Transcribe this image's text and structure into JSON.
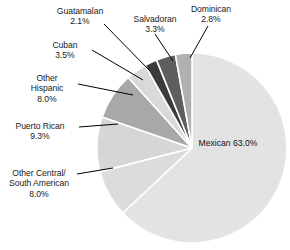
{
  "chart_data": {
    "type": "pie",
    "title": "",
    "subtitle": "",
    "xlabel": "",
    "ylabel": "",
    "legend_position": "none",
    "grid": false,
    "units": "percent",
    "total": 100.0,
    "start_angle_deg": 0,
    "direction": "clockwise",
    "categories": [
      "Mexican",
      "Other Central/ South American",
      "Puerto Rican",
      "Other Hispanic",
      "Cuban",
      "Guatamalan",
      "Salvadoran",
      "Dominican"
    ],
    "values": [
      63.0,
      8.0,
      9.3,
      8.0,
      3.5,
      2.1,
      3.3,
      2.8
    ],
    "slices": [
      {
        "name": "Mexican",
        "value": 63.0,
        "value_label": "63.0%",
        "color": "#e3e3e3",
        "label_placement": "inside"
      },
      {
        "name": "Other Central/ South American",
        "value": 8.0,
        "value_label": "8.0%",
        "color": "#dcdcdc",
        "label_placement": "outside"
      },
      {
        "name": "Puerto Rican",
        "value": 9.3,
        "value_label": "9.3%",
        "color": "#d6d6d6",
        "label_placement": "outside"
      },
      {
        "name": "Other Hispanic",
        "value": 8.0,
        "value_label": "8.0%",
        "color": "#a8a8a8",
        "label_placement": "outside"
      },
      {
        "name": "Cuban",
        "value": 3.5,
        "value_label": "3.5%",
        "color": "#d9d9d9",
        "label_placement": "outside"
      },
      {
        "name": "Guatamalan",
        "value": 2.1,
        "value_label": "2.1%",
        "color": "#3b3b3b",
        "label_placement": "outside"
      },
      {
        "name": "Salvadoran",
        "value": 3.3,
        "value_label": "3.3%",
        "color": "#5e5e5e",
        "label_placement": "outside"
      },
      {
        "name": "Dominican",
        "value": 2.8,
        "value_label": "2.8%",
        "color": "#b0b0b0",
        "label_placement": "outside"
      }
    ]
  },
  "labels": {
    "guatamalan": {
      "name": "Guatamalan",
      "value": "2.1%"
    },
    "salvadoran": {
      "name": "Salvadoran",
      "value": "3.3%"
    },
    "dominican": {
      "name": "Dominican",
      "value": "2.8%"
    },
    "cuban": {
      "name": "Cuban",
      "value": "3.5%"
    },
    "other_hispanic": {
      "line1": "Other",
      "line2": "Hispanic",
      "value": "8.0%"
    },
    "puerto_rican": {
      "name": "Puerto Rican",
      "value": "9.3%"
    },
    "other_central_south": {
      "line1": "Other Central/",
      "line2": "South American",
      "value": "8.0%"
    },
    "mexican": {
      "name": "Mexican",
      "value": "63.0%"
    }
  },
  "style": {
    "background": "#ffffff",
    "separator_color": "#ffffff",
    "leader_line_color": "#000000",
    "text_color": "#1a1a1a"
  }
}
